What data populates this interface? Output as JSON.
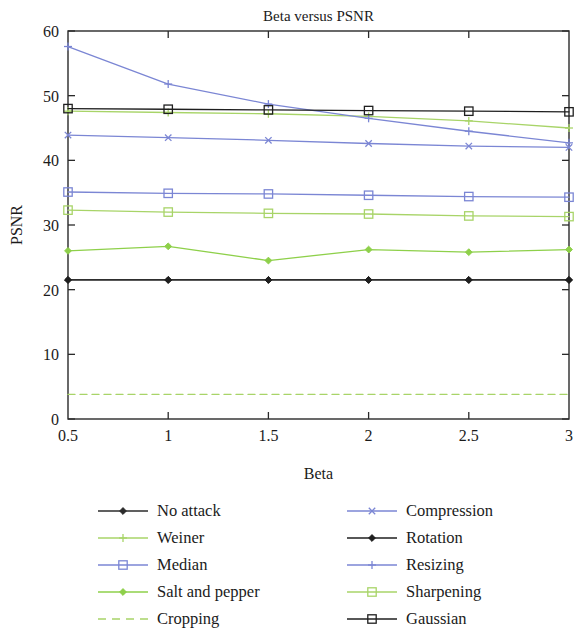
{
  "chart_data": {
    "type": "line",
    "title": "Beta versus PSNR",
    "xlabel": "Beta",
    "ylabel": "PSNR",
    "x": [
      0.5,
      1,
      1.5,
      2,
      2.5,
      3
    ],
    "xlim": [
      0.5,
      3
    ],
    "ylim": [
      0,
      60
    ],
    "xticks": [
      "0.5",
      "1",
      "1.5",
      "2",
      "2.5",
      "3"
    ],
    "yticks": [
      "0",
      "10",
      "20",
      "30",
      "40",
      "50",
      "60"
    ],
    "grid": false,
    "legend_position": "below-two-columns",
    "series": [
      {
        "name": "No attack",
        "color": "#2b2b2b",
        "marker": "diamond",
        "dash": "solid",
        "values": [
          21.5,
          21.5,
          21.5,
          21.5,
          21.5,
          21.5
        ]
      },
      {
        "name": "Weiner",
        "color": "#a8d468",
        "marker": "plus",
        "dash": "solid",
        "values": [
          47.6,
          47.4,
          47.2,
          46.8,
          46.1,
          45.0
        ]
      },
      {
        "name": "Median",
        "color": "#7b86d4",
        "marker": "square",
        "dash": "solid",
        "values": [
          35.1,
          34.9,
          34.8,
          34.6,
          34.4,
          34.3
        ]
      },
      {
        "name": "Salt and pepper",
        "color": "#8ed04a",
        "marker": "diamond",
        "dash": "solid",
        "values": [
          26.0,
          26.7,
          24.5,
          26.2,
          25.8,
          26.2
        ]
      },
      {
        "name": "Cropping",
        "color": "#a8d468",
        "marker": "none",
        "dash": "dashed",
        "values": [
          3.8,
          3.8,
          3.8,
          3.8,
          3.8,
          3.8
        ]
      },
      {
        "name": "Compression",
        "color": "#7b86d4",
        "marker": "x",
        "dash": "solid",
        "values": [
          43.9,
          43.5,
          43.1,
          42.6,
          42.2,
          42.0
        ]
      },
      {
        "name": "Rotation",
        "color": "#1f1f1f",
        "marker": "diamond",
        "dash": "solid",
        "values": [
          21.5,
          21.5,
          21.5,
          21.5,
          21.5,
          21.5
        ]
      },
      {
        "name": "Resizing",
        "color": "#7b86d4",
        "marker": "plus",
        "dash": "solid",
        "values": [
          57.6,
          51.8,
          48.7,
          46.5,
          44.5,
          42.7
        ]
      },
      {
        "name": "Sharpening",
        "color": "#a8d468",
        "marker": "square",
        "dash": "solid",
        "values": [
          32.3,
          32.0,
          31.8,
          31.7,
          31.4,
          31.3
        ]
      },
      {
        "name": "Gaussian",
        "color": "#1f1f1f",
        "marker": "square",
        "dash": "solid",
        "values": [
          48.0,
          47.9,
          47.8,
          47.7,
          47.6,
          47.5
        ]
      }
    ]
  },
  "legend": {
    "columns": [
      {
        "items": [
          "No attack",
          "Weiner",
          "Median",
          "Salt and pepper",
          "Cropping"
        ]
      },
      {
        "items": [
          "Compression",
          "Rotation",
          "Resizing",
          "Sharpening",
          "Gaussian"
        ]
      }
    ]
  }
}
